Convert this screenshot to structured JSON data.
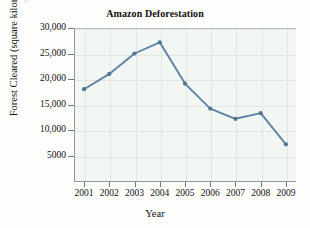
{
  "page": {
    "top_bleed_text": "p"
  },
  "chart_data": {
    "type": "line",
    "title": "Amazon Deforestation",
    "xlabel": "Year",
    "ylabel": "Forest Cleared (square kilometers)",
    "categories": [
      "2001",
      "2002",
      "2003",
      "2004",
      "2005",
      "2006",
      "2007",
      "2008",
      "2009"
    ],
    "x": [
      2001,
      2002,
      2003,
      2004,
      2005,
      2006,
      2007,
      2008,
      2009
    ],
    "values": [
      18000,
      21000,
      25000,
      27200,
      19100,
      14200,
      12200,
      13300,
      7200
    ],
    "series": [
      {
        "name": "Forest Cleared",
        "values": [
          18000,
          21000,
          25000,
          27200,
          19100,
          14200,
          12200,
          13300,
          7200
        ]
      }
    ],
    "xlim": [
      2000.6,
      2009.4
    ],
    "ylim": [
      0,
      30000
    ],
    "ytick_values": [
      5000,
      10000,
      15000,
      20000,
      25000,
      30000
    ],
    "ytick_labels": [
      "5000",
      "10,000",
      "15,000",
      "20,000",
      "25,000",
      "30,000"
    ],
    "xtick_labels": [
      "2001",
      "2002",
      "2003",
      "2004",
      "2005",
      "2006",
      "2007",
      "2008",
      "2009"
    ],
    "grid": true,
    "legend": "none",
    "marker": "circle",
    "colors": {
      "line": "#5f82a6",
      "marker": "#54748f",
      "grid": "#dfe7e5",
      "axis": "#8e9a9a",
      "plot_background": "#f2f7f4",
      "text": "#111111"
    }
  }
}
